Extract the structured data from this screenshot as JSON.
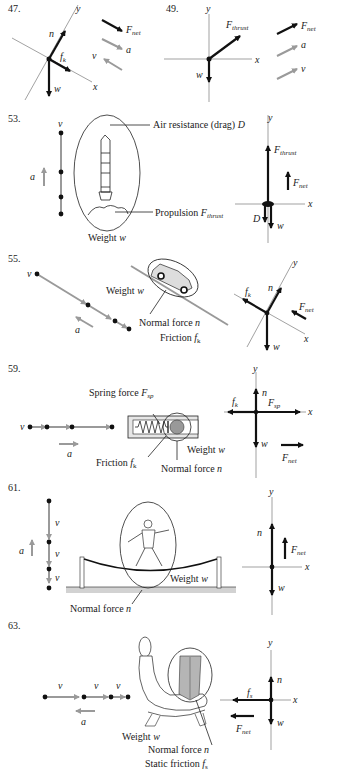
{
  "problems": [
    {
      "number": "47.",
      "axes": {
        "x": "x",
        "y": "y"
      },
      "forces": [
        "n",
        "f_k",
        "w"
      ],
      "labels": {
        "n": "n",
        "fk": "f",
        "fk_sub": "k",
        "w": "w"
      },
      "legend": {
        "fnet": "F",
        "fnet_sub": "net",
        "a": "a",
        "v": "v"
      }
    },
    {
      "number": "49.",
      "axes": {
        "x": "x",
        "y": "y"
      },
      "labels": {
        "fthrust": "F",
        "fthrust_sub": "thrust",
        "w": "w"
      },
      "legend": {
        "fnet": "F",
        "fnet_sub": "net",
        "a": "a",
        "v": "v"
      }
    },
    {
      "number": "53.",
      "motion": {
        "v": "v",
        "a": "a"
      },
      "callouts": {
        "drag": "Air resistance (drag) ",
        "drag_sym": "D",
        "propulsion": "Propulsion ",
        "prop_sym": "F",
        "prop_sub": "thrust",
        "weight": "Weight ",
        "weight_sym": "w"
      },
      "axes": {
        "x": "x",
        "y": "y"
      },
      "labels": {
        "fthrust": "F",
        "fthrust_sub": "thrust",
        "fnet": "F",
        "fnet_sub": "net",
        "D": "D",
        "w": "w"
      }
    },
    {
      "number": "55.",
      "motion": {
        "v": "v",
        "a": "a"
      },
      "callouts": {
        "weight": "Weight ",
        "weight_sym": "w",
        "normal": "Normal force ",
        "normal_sym": "n",
        "friction": "Friction ",
        "friction_sym": "f",
        "friction_sub": "k"
      },
      "axes": {
        "x": "x",
        "y": "y"
      },
      "labels": {
        "fk": "f",
        "fk_sub": "k",
        "n": "n",
        "fnet": "F",
        "fnet_sub": "net",
        "w": "w"
      }
    },
    {
      "number": "59.",
      "motion": {
        "v": "v",
        "a": "a"
      },
      "callouts": {
        "spring": "Spring force ",
        "spring_sym": "F",
        "spring_sub": "sp",
        "weight": "Weight ",
        "weight_sym": "w",
        "friction": "Friction ",
        "friction_sym": "f",
        "friction_sub": "k",
        "normal": "Normal force ",
        "normal_sym": "n"
      },
      "axes": {
        "x": "x",
        "y": "y"
      },
      "labels": {
        "n": "n",
        "fk": "f",
        "fk_sub": "k",
        "fsp": "F",
        "fsp_sub": "sp",
        "w": "w",
        "fnet": "F",
        "fnet_sub": "net"
      }
    },
    {
      "number": "61.",
      "motion": {
        "v": "v",
        "a": "a"
      },
      "callouts": {
        "weight": "Weight ",
        "weight_sym": "w",
        "normal": "Normal force ",
        "normal_sym": "n"
      },
      "axes": {
        "x": "x",
        "y": "y"
      },
      "labels": {
        "n": "n",
        "fnet": "F",
        "fnet_sub": "net",
        "w": "w"
      }
    },
    {
      "number": "63.",
      "motion": {
        "v": "v",
        "a": "a"
      },
      "callouts": {
        "weight": "Weight ",
        "weight_sym": "w",
        "normal": "Normal force ",
        "normal_sym": "n",
        "static": "Static friction ",
        "static_sym": "f",
        "static_sub": "s"
      },
      "axes": {
        "x": "x",
        "y": "y"
      },
      "labels": {
        "n": "n",
        "fs": "f",
        "fs_sub": "s",
        "w": "w",
        "fnet": "F",
        "fnet_sub": "net"
      }
    }
  ],
  "colors": {
    "force": "#111111",
    "kinematic": "#9a9a9a",
    "axis": "#7a7a7a",
    "shade": "#bdbdbd"
  }
}
